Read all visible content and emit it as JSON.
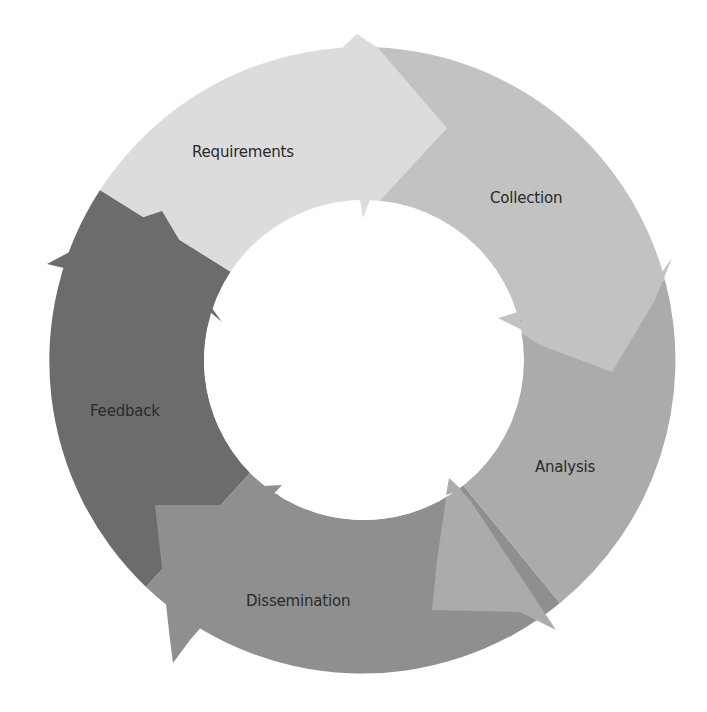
{
  "diagram": {
    "type": "cycle",
    "center": [
      363,
      360
    ],
    "outer_radius": 313,
    "inner_radius": 160,
    "stages": [
      {
        "label": "Requirements",
        "color": "#dcdcdc",
        "label_pos": [
          192,
          143
        ]
      },
      {
        "label": "Collection",
        "color": "#c2c2c2",
        "label_pos": [
          490,
          189
        ]
      },
      {
        "label": "Analysis",
        "color": "#ababab",
        "label_pos": [
          535,
          458
        ]
      },
      {
        "label": "Dissemination",
        "color": "#8f8f8f",
        "label_pos": [
          246,
          592
        ]
      },
      {
        "label": "Feedback",
        "color": "#6c6c6c",
        "label_pos": [
          90,
          402
        ]
      }
    ]
  }
}
